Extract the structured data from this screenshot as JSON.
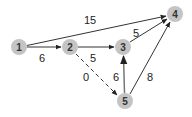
{
  "diagram": {
    "type": "directed-weighted-graph",
    "node_color": "#c4c4c4",
    "edge_color": "#333333",
    "nodes": [
      {
        "id": "1",
        "label": "1",
        "x": 19,
        "y": 47
      },
      {
        "id": "2",
        "label": "2",
        "x": 70,
        "y": 47
      },
      {
        "id": "3",
        "label": "3",
        "x": 123,
        "y": 47
      },
      {
        "id": "4",
        "label": "4",
        "x": 175,
        "y": 14
      },
      {
        "id": "5",
        "label": "5",
        "x": 125,
        "y": 101
      }
    ],
    "edges": [
      {
        "from": "1",
        "to": "4",
        "weight": "15",
        "style": "solid"
      },
      {
        "from": "1",
        "to": "2",
        "weight": "6",
        "style": "solid"
      },
      {
        "from": "2",
        "to": "3",
        "weight": "5",
        "style": "solid"
      },
      {
        "from": "3",
        "to": "4",
        "weight": "5",
        "style": "solid"
      },
      {
        "from": "2",
        "to": "5",
        "weight": "0",
        "style": "dashed"
      },
      {
        "from": "5",
        "to": "3",
        "weight": "6",
        "style": "solid"
      },
      {
        "from": "5",
        "to": "4",
        "weight": "8",
        "style": "solid"
      }
    ]
  }
}
